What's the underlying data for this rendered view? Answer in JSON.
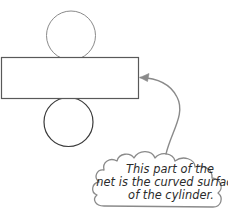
{
  "diagram": {
    "shapes": {
      "top_circle": {
        "name": "top-circle",
        "label": "top circular base of cylinder net",
        "cx": 71,
        "cy": 35.5,
        "r": 24.5,
        "stroke": "#8a8a8a",
        "stroke_width": 1,
        "fill": "#ffffff"
      },
      "rectangle": {
        "name": "curved-surface-rectangle",
        "label": "rectangle representing the curved surface",
        "x": 1.5,
        "y": 57.5,
        "width": 137,
        "height": 41,
        "stroke": "#595959",
        "stroke_width": 1.2,
        "fill": "#ffffff"
      },
      "bottom_circle": {
        "name": "bottom-circle",
        "label": "bottom circular base of cylinder net",
        "cx": 68.5,
        "cy": 122,
        "r": 24.5,
        "stroke": "#3a3a3a",
        "stroke_width": 1.2,
        "fill": "#ffffff"
      }
    },
    "arrow": {
      "name": "callout-arrow",
      "label": "curved arrow pointing at the rectangle",
      "path": "M 166 154 C 171 132 186 114 177 97 C 170 83 156 78 140 77.5",
      "stroke": "#8a8a8a",
      "stroke_width": 1.4,
      "head_points": "140,77.5 149,73.5 147.5,81.5",
      "tip_x": 139,
      "tip_y": 77.5
    },
    "callout": {
      "name": "cloud-callout",
      "stroke": "#8a8a8a",
      "stroke_width": 1.3,
      "fill": "#ffffff",
      "lines": [
        {
          "text": "This part of the",
          "x": 170,
          "y": 173,
          "anchor": "middle"
        },
        {
          "text": "net is the curved surface",
          "x": 168,
          "y": 186,
          "anchor": "middle"
        },
        {
          "text": "of the cylinder.",
          "x": 171,
          "y": 199,
          "anchor": "middle"
        }
      ],
      "full_text": "This part of the net is the curved surface of the cylinder."
    },
    "colors": {
      "background": "#ffffff",
      "light_stroke": "#8a8a8a",
      "mid_stroke": "#595959",
      "dark_stroke": "#3a3a3a",
      "text": "#2b2b2b"
    }
  }
}
